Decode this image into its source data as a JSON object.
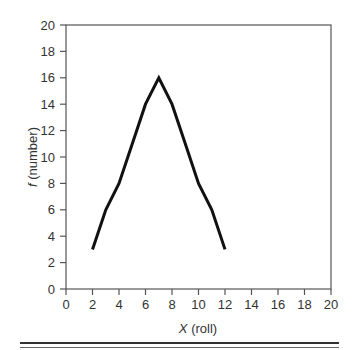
{
  "chart_data": {
    "type": "line",
    "title": "",
    "xlabel_var": "X",
    "xlabel_rest": " (roll)",
    "ylabel_var": "f",
    "ylabel_rest": " (number)",
    "xlim": [
      0,
      20
    ],
    "ylim": [
      0,
      20
    ],
    "xticks": [
      0,
      2,
      4,
      6,
      8,
      10,
      12,
      14,
      16,
      18,
      20
    ],
    "yticks": [
      0,
      2,
      4,
      6,
      8,
      10,
      12,
      14,
      16,
      18,
      20
    ],
    "grid": false,
    "legend": null,
    "series": [
      {
        "name": "frequency",
        "color": "#111111",
        "x": [
          2,
          3,
          4,
          5,
          6,
          7,
          8,
          9,
          10,
          11,
          12
        ],
        "y": [
          3,
          6,
          8,
          11,
          14,
          16,
          14,
          11,
          8,
          6,
          3
        ]
      }
    ]
  },
  "colors": {
    "axis": "#555555",
    "line": "#111111",
    "text": "#333333"
  }
}
